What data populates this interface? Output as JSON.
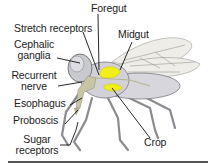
{
  "diagram": {
    "labels": {
      "foregut": "Foregut",
      "stretch_receptors": "Stretch receptors",
      "midgut": "Midgut",
      "cephalic_ganglia_1": "Cephalic",
      "cephalic_ganglia_2": "ganglia",
      "recurrent_nerve_1": "Recurrent",
      "recurrent_nerve_2": "nerve",
      "esophagus": "Esophagus",
      "proboscis": "Proboscis",
      "sugar_receptors_1": "Sugar",
      "sugar_receptors_2": "receptors",
      "crop": "Crop"
    },
    "colors": {
      "body": "#cfcfd6",
      "outline": "#7a7a82",
      "gut_highlight": "#f2ee1a",
      "nerve": "#b8b592",
      "wing": "#ecebe6",
      "leader_line": "#111111",
      "rule": "#555555"
    }
  }
}
